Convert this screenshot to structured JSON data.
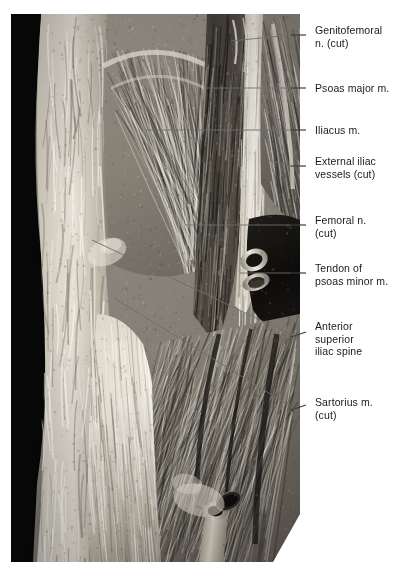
{
  "figure": {
    "kind": "anatomical-photograph",
    "background_color": "#ffffff",
    "photo": {
      "border_color": "#0b0b0b",
      "tone_light": "#e8e5df",
      "tone_mid": "#9c968d",
      "tone_dark": "#3a372f",
      "x": 11,
      "y": 14,
      "width": 289,
      "height": 548
    },
    "leader_color": "#6e6e6e"
  },
  "labels": [
    {
      "id": "genitofemoral-nerve-cut",
      "text": "Genitofemoral\nn. (cut)",
      "text_x": 315,
      "text_y": 24,
      "dash": {
        "x1": 291,
        "y1": 35,
        "x2": 306,
        "y2": 35
      },
      "leader": {
        "x1": 291,
        "y1": 35,
        "x2": 231,
        "y2": 41
      }
    },
    {
      "id": "psoas-major-muscle",
      "text": "Psoas major m.",
      "text_x": 315,
      "text_y": 82,
      "dash": {
        "x1": 291,
        "y1": 88,
        "x2": 306,
        "y2": 88
      },
      "leader": {
        "x1": 291,
        "y1": 88,
        "x2": 204,
        "y2": 88
      }
    },
    {
      "id": "iliacus-muscle",
      "text": "Iliacus m.",
      "text_x": 315,
      "text_y": 124,
      "dash": {
        "x1": 291,
        "y1": 130,
        "x2": 306,
        "y2": 130
      },
      "leader": {
        "x1": 291,
        "y1": 130,
        "x2": 145,
        "y2": 130
      }
    },
    {
      "id": "external-iliac-vessels-cut",
      "text": "External iliac\nvessels (cut)",
      "text_x": 315,
      "text_y": 155,
      "dash": {
        "x1": 291,
        "y1": 166,
        "x2": 306,
        "y2": 166
      },
      "leader": {
        "x1": 291,
        "y1": 166,
        "x2": 268,
        "y2": 160
      }
    },
    {
      "id": "femoral-nerve-cut",
      "text": "Femoral n.\n(cut)",
      "text_x": 315,
      "text_y": 214,
      "dash": {
        "x1": 291,
        "y1": 225,
        "x2": 306,
        "y2": 225
      },
      "leader": {
        "x1": 291,
        "y1": 225,
        "x2": 185,
        "y2": 225
      }
    },
    {
      "id": "tendon-of-psoas-minor-muscle",
      "text": "Tendon of\npsoas minor m.",
      "text_x": 315,
      "text_y": 262,
      "dash": {
        "x1": 291,
        "y1": 273,
        "x2": 306,
        "y2": 273
      },
      "leader": {
        "x1": 291,
        "y1": 273,
        "x2": 239,
        "y2": 273
      }
    },
    {
      "id": "anterior-superior-iliac-spine",
      "text": "Anterior\nsuperior\niliac spine",
      "text_x": 315,
      "text_y": 320,
      "dash": {
        "x1": 291,
        "y1": 337,
        "x2": 306,
        "y2": 332
      },
      "leader": {
        "x1": 298,
        "y1": 338,
        "x2": 92,
        "y2": 240
      }
    },
    {
      "id": "sartorius-muscle-cut",
      "text": "Sartorius m.\n(cut)",
      "text_x": 315,
      "text_y": 396,
      "dash": {
        "x1": 291,
        "y1": 410,
        "x2": 306,
        "y2": 405
      },
      "leader": {
        "x1": 298,
        "y1": 411,
        "x2": 114,
        "y2": 298
      }
    }
  ]
}
